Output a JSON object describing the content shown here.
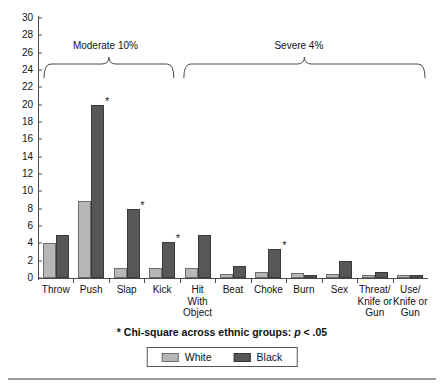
{
  "chart_data": {
    "type": "bar",
    "title": "",
    "xlabel": "",
    "ylabel": "",
    "ylim": [
      0,
      30
    ],
    "ytick_step": 2,
    "yticks": [
      "0",
      "2",
      "4",
      "6",
      "8",
      "10",
      "12",
      "14",
      "16",
      "18",
      "20",
      "22",
      "24",
      "26",
      "28",
      "30"
    ],
    "grid": false,
    "legend_position": "bottom",
    "categories": [
      "Throw",
      "Push",
      "Slap",
      "Kick",
      "Hit\nWith\nObject",
      "Beat",
      "Choke",
      "Burn",
      "Sex",
      "Threat/\nKnife or\nGun",
      "Use/\nKnife or\nGun"
    ],
    "series": [
      {
        "name": "White",
        "color": "#b7b7b7",
        "values": [
          4.0,
          8.9,
          1.1,
          1.1,
          1.1,
          0.5,
          0.7,
          0.6,
          0.5,
          0.4,
          0.3
        ]
      },
      {
        "name": "Black",
        "color": "#575757",
        "values": [
          5.0,
          20.0,
          8.0,
          4.1,
          5.0,
          1.4,
          3.3,
          0.3,
          2.0,
          0.7,
          0.3
        ]
      }
    ],
    "significance_markers": [
      {
        "category": "Push",
        "series": "Black",
        "symbol": "*"
      },
      {
        "category": "Slap",
        "series": "Black",
        "symbol": "*"
      },
      {
        "category": "Kick",
        "series": "Black",
        "symbol": "*"
      },
      {
        "category": "Choke",
        "series": "Black",
        "symbol": "*"
      }
    ],
    "annotations": [
      {
        "type": "bracket",
        "label": "Moderate 10%",
        "covers": [
          "Throw",
          "Push",
          "Slap",
          "Kick"
        ]
      },
      {
        "type": "bracket",
        "label": "Severe 4%",
        "covers": [
          "Hit With Object",
          "Beat",
          "Choke",
          "Burn",
          "Sex",
          "Threat/Knife or Gun",
          "Use/Knife or Gun"
        ]
      }
    ],
    "footnote": {
      "prefix": "* Chi-square across ethnic groups: ",
      "p_symbol": "p",
      "suffix": " < .05"
    }
  },
  "legend": {
    "items": [
      {
        "label": "White"
      },
      {
        "label": "Black"
      }
    ]
  }
}
